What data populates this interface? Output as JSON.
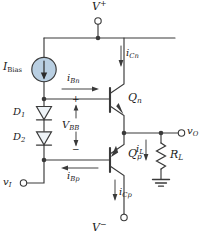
{
  "figure": {
    "type": "circuit-schematic",
    "line_color": "#3a3a3a",
    "fill_accent": "#b9cfe2",
    "text_color": "#1a1a1a"
  },
  "terminals": [
    {
      "name": "vplus-terminal",
      "label_main": "V",
      "label_sup": "+",
      "x": 98,
      "y": 10
    },
    {
      "name": "vminus-terminal",
      "label_main": "V",
      "label_sup": "−",
      "x": 98,
      "y": 228
    },
    {
      "name": "vi-terminal",
      "label_main": "v",
      "label_sub": "I",
      "x": 10,
      "y": 185
    },
    {
      "name": "vo-terminal",
      "label_main": "v",
      "label_sub": "O",
      "x": 185,
      "y": 128
    }
  ],
  "components": [
    {
      "name": "current-source-ibias",
      "label_main": "I",
      "label_sub": "Bias",
      "kind": "current-source",
      "direction": "down"
    },
    {
      "name": "diode-d1",
      "label_main": "D",
      "label_sub": "1",
      "kind": "diode",
      "direction": "down"
    },
    {
      "name": "diode-d2",
      "label_main": "D",
      "label_sub": "2",
      "kind": "diode",
      "direction": "down"
    },
    {
      "name": "transistor-qn",
      "label_main": "Q",
      "label_sub": "n",
      "kind": "bjt-npn"
    },
    {
      "name": "transistor-qp",
      "label_main": "Q",
      "label_sub": "p",
      "kind": "bjt-pnp"
    },
    {
      "name": "resistor-rl",
      "label_main": "R",
      "label_sub": "L",
      "kind": "resistor"
    },
    {
      "name": "ground-symbol",
      "kind": "ground"
    }
  ],
  "annotations": [
    {
      "name": "label-ibias",
      "text_main": "I",
      "text_sub": "Bias",
      "sub_style": "roman",
      "x": 6,
      "y": 62,
      "size": "sz11"
    },
    {
      "name": "label-ibn",
      "text_main": "i",
      "text_sub": "Bn",
      "sub_style": "italic",
      "x": 66,
      "y": 74,
      "size": "sz10"
    },
    {
      "name": "label-icn",
      "text_main": "i",
      "text_sub": "Cn",
      "sub_style": "italic",
      "x": 128,
      "y": 51,
      "size": "sz10"
    },
    {
      "name": "label-vbb",
      "text_main": "V",
      "text_sub": "BB",
      "sub_style": "italic",
      "x": 63,
      "y": 122,
      "size": "sz10"
    },
    {
      "name": "label-qn",
      "text_main": "Q",
      "text_sub": "n",
      "sub_style": "italic",
      "x": 117,
      "y": 93,
      "size": "sz11"
    },
    {
      "name": "label-qp",
      "text_main": "Q",
      "text_sub": "p",
      "sub_style": "italic",
      "x": 117,
      "y": 148,
      "size": "sz11"
    },
    {
      "name": "label-d1",
      "text_main": "D",
      "text_sub": "1",
      "sub_style": "italic",
      "x": 12,
      "y": 112,
      "size": "sz10"
    },
    {
      "name": "label-d2",
      "text_main": "D",
      "text_sub": "2",
      "sub_style": "italic",
      "x": 12,
      "y": 138,
      "size": "sz10"
    },
    {
      "name": "label-ibp",
      "text_main": "i",
      "text_sub": "Bp",
      "sub_style": "italic",
      "x": 66,
      "y": 170,
      "size": "sz10"
    },
    {
      "name": "label-icp",
      "text_main": "i",
      "text_sub": "Cp",
      "sub_style": "italic",
      "x": 122,
      "y": 189,
      "size": "sz10"
    },
    {
      "name": "label-il",
      "text_main": "i",
      "text_sub": "L",
      "sub_style": "italic",
      "x": 139,
      "y": 147,
      "size": "sz10"
    },
    {
      "name": "label-rl",
      "text_main": "R",
      "text_sub": "L",
      "sub_style": "italic",
      "x": 173,
      "y": 152,
      "size": "sz11"
    },
    {
      "name": "label-vplus",
      "text_main": "V",
      "text_sup": "+",
      "x": 92,
      "y": 2,
      "size": "sz11"
    },
    {
      "name": "label-vminus",
      "text_main": "V",
      "text_sup": "−",
      "x": 92,
      "y": 226,
      "size": "sz11"
    },
    {
      "name": "label-vi",
      "text_main": "v",
      "text_sub": "I",
      "sub_style": "italic",
      "x": 2,
      "y": 178,
      "size": "sz10"
    },
    {
      "name": "label-vo",
      "text_main": "v",
      "text_sub": "O",
      "sub_style": "italic",
      "x": 188,
      "y": 120,
      "size": "sz10"
    },
    {
      "name": "label-vbb-plus",
      "text_main": "+",
      "x": 71,
      "y": 99,
      "size": "sz9"
    },
    {
      "name": "label-vbb-minus",
      "text_main": "−",
      "x": 71,
      "y": 150,
      "size": "sz9"
    }
  ],
  "currents": [
    {
      "name": "current-arrow-ibn",
      "flows": "right",
      "into": "base-of-qn"
    },
    {
      "name": "current-arrow-icn",
      "flows": "down",
      "into": "collector-of-qn"
    },
    {
      "name": "current-arrow-ibp",
      "flows": "left",
      "into": "diode-node"
    },
    {
      "name": "current-arrow-icp",
      "flows": "down",
      "into": "vminus"
    },
    {
      "name": "current-arrow-il",
      "flows": "down",
      "into": "load-resistor"
    }
  ]
}
